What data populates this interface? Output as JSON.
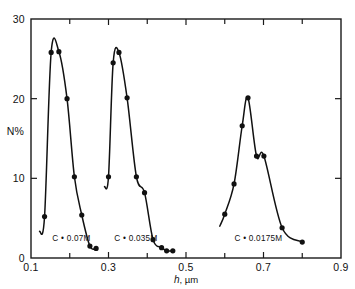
{
  "chart_data": {
    "type": "line",
    "title": "",
    "subtitle": "",
    "xlabel": "h , µm",
    "xlabel_symbol": "h",
    "xlabel_unit": ", µm",
    "ylabel": "N%",
    "xlim": [
      0.1,
      0.9
    ],
    "ylim": [
      0,
      30
    ],
    "xticks": [
      0.1,
      0.3,
      0.5,
      0.7,
      0.9
    ],
    "xticklabels": [
      "0.1",
      "0.3",
      "0.5",
      "0.7",
      "0.9"
    ],
    "xminorticks": [
      0.2,
      0.4,
      0.6,
      0.8
    ],
    "yticks": [
      0,
      10,
      20,
      30
    ],
    "yticklabels": [
      "0",
      "10",
      "20",
      "30"
    ],
    "grid": false,
    "legend_position": "inline-annotations",
    "marker": "filled-circle",
    "line_color": "#111111",
    "marker_color": "#111111",
    "background_color": "#ffffff",
    "series": [
      {
        "name": "C = 0.07M",
        "label": "C • 0.07M",
        "annotation_x": 0.155,
        "annotation_y": 2.1,
        "x": [
          0.135,
          0.152,
          0.172,
          0.193,
          0.212,
          0.231,
          0.252,
          0.268
        ],
        "y": [
          5.2,
          25.8,
          25.9,
          20.0,
          10.2,
          5.4,
          1.5,
          1.2
        ],
        "values": [
          5.2,
          25.8,
          25.9,
          20.0,
          10.2,
          5.4,
          1.5,
          1.2
        ]
      },
      {
        "name": "C = 0.035M",
        "label": "C • 0.035M",
        "annotation_x": 0.315,
        "annotation_y": 2.1,
        "x": [
          0.3,
          0.312,
          0.327,
          0.348,
          0.372,
          0.393,
          0.415,
          0.437,
          0.45,
          0.466
        ],
        "y": [
          10.2,
          24.5,
          25.8,
          20.1,
          10.2,
          8.2,
          2.3,
          1.3,
          0.9,
          0.9
        ],
        "values": [
          10.2,
          24.5,
          25.8,
          20.1,
          10.2,
          8.2,
          2.3,
          1.3,
          0.9,
          0.9
        ]
      },
      {
        "name": "C = 0.0175M",
        "label": "C • 0.0175M",
        "annotation_x": 0.625,
        "annotation_y": 2.1,
        "x": [
          0.6,
          0.624,
          0.645,
          0.66,
          0.682,
          0.701,
          0.748,
          0.8
        ],
        "y": [
          5.5,
          9.3,
          16.6,
          20.1,
          12.8,
          12.8,
          3.8,
          2.0
        ],
        "values": [
          5.5,
          9.3,
          16.6,
          20.1,
          12.8,
          12.8,
          3.8,
          2.0
        ]
      }
    ]
  },
  "figure": {
    "frame_color": "#1a1a1a"
  }
}
